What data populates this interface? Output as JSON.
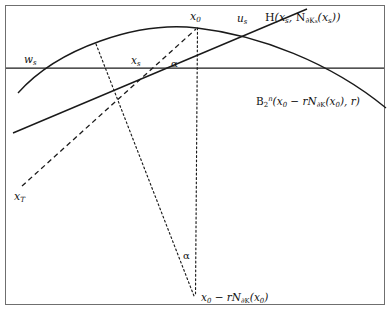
{
  "figure": {
    "type": "geometric-diagram",
    "background_color": "#ffffff",
    "stroke_color": "#1a1a1a",
    "frame": {
      "present": true,
      "x": 5,
      "y": 5,
      "width": 380,
      "height": 300
    }
  },
  "labels": {
    "hyperplane": "H(xs, N∂Ks(xs))",
    "hyperplane_parts": {
      "head": "H(x",
      "sub1": "s",
      "mid": ", N",
      "sub2": "∂K",
      "sub2b": "s",
      "mid2": "(x",
      "sub3": "s",
      "tail": "))"
    },
    "ball": "B2n(x0 − rN∂K(x0), r)",
    "ball_parts": {
      "head": "B",
      "sub": "2",
      "sup": "n",
      "open": "(x",
      "sub0": "0",
      "minus": " − rN",
      "subk": "∂K",
      "openx": "(x",
      "sub0b": "0",
      "close": "), r)"
    },
    "x0": "x0",
    "x0_base": "x",
    "x0_sub": "0",
    "us": "us",
    "us_base": "u",
    "us_sub": "s",
    "ws": "ws",
    "ws_base": "w",
    "ws_sub": "s",
    "xs": "xs",
    "xs_base": "x",
    "xs_sub": "s",
    "alpha_top": "α",
    "alpha_bottom": "α",
    "xT": "xT",
    "xT_base": "x",
    "xT_sub": "T",
    "center": "x0 − rN∂K(x0)",
    "center_parts": {
      "head": "x",
      "sub0": "0",
      "minus": " − rN",
      "subk": "∂K",
      "openx": "(x",
      "sub0b": "0",
      "close": ")"
    }
  },
  "geometry": {
    "horizontal_line": {
      "x1": 6,
      "y1": 68,
      "x2": 384,
      "y2": 68,
      "style": "solid"
    },
    "arc_boundary": {
      "style": "solid",
      "description": "boundary of convex body K, shallow downward arc",
      "path": "M 18,93 C 60,47 140,22 197,28 C 260,34 330,62 386,107"
    },
    "tangent_line": {
      "style": "solid",
      "description": "line through xs and us rising to upper right",
      "x1": 13,
      "y1": 133,
      "x2": 307,
      "y2": 9
    },
    "dashed_line_xT_x0": {
      "style": "dashed",
      "description": "dashed segment from xT through xs up to x0",
      "x1": 22,
      "y1": 186,
      "x2": 196,
      "y2": 29
    },
    "dotted_line_normal": {
      "style": "dotted",
      "description": "dotted line from arc through xs down to center x0 - rN",
      "x1": 96,
      "y1": 44,
      "x2": 194,
      "y2": 296
    },
    "dotted_line_vertical": {
      "style": "dotted",
      "description": "dotted vertical from x0 down to center",
      "x1": 197,
      "y1": 28,
      "x2": 195,
      "y2": 296
    },
    "points": {
      "ws": {
        "x": 37,
        "y": 68
      },
      "xs": {
        "x": 148,
        "y": 68
      },
      "us": {
        "x": 244,
        "y": 29
      },
      "x0": {
        "x": 197,
        "y": 28
      },
      "center": {
        "x": 195,
        "y": 296
      },
      "xT": {
        "x": 22,
        "y": 186
      }
    }
  }
}
